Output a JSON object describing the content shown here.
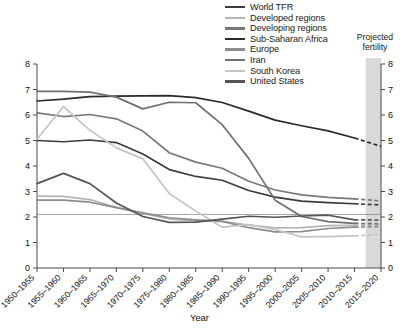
{
  "chart_data": {
    "type": "line",
    "title": "",
    "xlabel": "Year",
    "ylabel": "",
    "ylim": [
      0,
      8
    ],
    "yticks": [
      0,
      1,
      2,
      3,
      4,
      5,
      6,
      7,
      8
    ],
    "right_axis": true,
    "right_yticks": [
      0,
      1,
      2,
      3,
      4,
      5,
      6,
      7,
      8
    ],
    "grid": false,
    "legend_position": "top-right",
    "categories": [
      "1950–1955",
      "1955–1960",
      "1960–1965",
      "1965–1970",
      "1970–1975",
      "1975–1980",
      "1980–1985",
      "1985–1990",
      "1990–1995",
      "1995–2000",
      "2000–2005",
      "2005–2010",
      "2010–2015",
      "2015–2020"
    ],
    "annotations": [
      {
        "text": "Projected fertility",
        "x": "2015–2020",
        "note": "shaded band over final period"
      }
    ],
    "projection_start_category": "2010–2015",
    "replacement_line_y": 2.1,
    "series": [
      {
        "name": "World TFR",
        "color": "#3c3c3c",
        "values": [
          5.0,
          4.95,
          5.02,
          4.92,
          4.47,
          3.86,
          3.59,
          3.44,
          3.04,
          2.78,
          2.62,
          2.56,
          2.52,
          2.47
        ]
      },
      {
        "name": "Developed regions",
        "color": "#b4b4b4",
        "values": [
          2.82,
          2.81,
          2.68,
          2.38,
          2.14,
          1.92,
          1.85,
          1.83,
          1.68,
          1.57,
          1.58,
          1.66,
          1.67,
          1.69
        ]
      },
      {
        "name": "Developing regions",
        "color": "#787878",
        "values": [
          6.08,
          5.94,
          6.02,
          5.85,
          5.37,
          4.52,
          4.15,
          3.91,
          3.4,
          3.06,
          2.87,
          2.77,
          2.71,
          2.63
        ]
      },
      {
        "name": "Sub-Saharan Africa",
        "color": "#2b2b2b",
        "values": [
          6.55,
          6.62,
          6.72,
          6.74,
          6.75,
          6.76,
          6.68,
          6.49,
          6.15,
          5.8,
          5.58,
          5.38,
          5.1,
          4.77
        ]
      },
      {
        "name": "Europe",
        "color": "#8c8c8c",
        "values": [
          2.66,
          2.66,
          2.58,
          2.37,
          2.16,
          1.97,
          1.89,
          1.83,
          1.58,
          1.42,
          1.43,
          1.55,
          1.6,
          1.62
        ]
      },
      {
        "name": "Iran",
        "color": "#707070",
        "values": [
          6.93,
          6.93,
          6.9,
          6.7,
          6.24,
          6.5,
          6.48,
          5.62,
          4.3,
          2.66,
          2.02,
          1.82,
          1.75,
          1.73
        ]
      },
      {
        "name": "South Korea",
        "color": "#c4c4c4",
        "values": [
          5.05,
          6.33,
          5.4,
          4.71,
          4.28,
          2.92,
          2.23,
          1.6,
          1.7,
          1.51,
          1.22,
          1.23,
          1.26,
          1.32
        ]
      },
      {
        "name": "United States",
        "color": "#555555",
        "values": [
          3.31,
          3.71,
          3.31,
          2.55,
          2.02,
          1.79,
          1.8,
          1.92,
          2.03,
          1.99,
          2.04,
          2.07,
          1.89,
          1.88
        ]
      }
    ]
  },
  "legend": {
    "items": [
      {
        "label": "World TFR",
        "color": "#3c3c3c"
      },
      {
        "label": "Developed regions",
        "color": "#b4b4b4"
      },
      {
        "label": "Developing regions",
        "color": "#787878"
      },
      {
        "label": "Sub-Saharan Africa",
        "color": "#2b2b2b"
      },
      {
        "label": "Europe",
        "color": "#8c8c8c"
      },
      {
        "label": "Iran",
        "color": "#707070"
      },
      {
        "label": "South Korea",
        "color": "#c4c4c4"
      },
      {
        "label": "United States",
        "color": "#555555"
      }
    ]
  },
  "projection": {
    "label_line1": "Projected",
    "label_line2": "fertility",
    "band_color": "#d9d9d9"
  },
  "axes": {
    "x_title": "Year",
    "y_left_ticks": [
      "0",
      "1",
      "2",
      "3",
      "4",
      "5",
      "6",
      "7",
      "8"
    ],
    "y_right_ticks": [
      "0",
      "1",
      "2",
      "3",
      "4",
      "5",
      "6",
      "7",
      "8"
    ],
    "x_tick_labels": [
      "1950–1955",
      "1955–1960",
      "1960–1965",
      "1965–1970",
      "1970–1975",
      "1975–1980",
      "1980–1985",
      "1985–1990",
      "1990–1995",
      "1995–2000",
      "2000–2005",
      "2005–2010",
      "2010–2015",
      "2015–2020"
    ]
  }
}
